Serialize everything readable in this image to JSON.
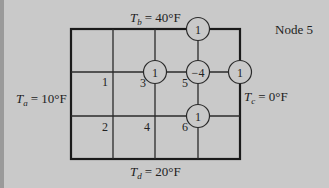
{
  "title": "Node 5",
  "boundaries": {
    "top": {
      "symbol": "T",
      "subscript": "b",
      "value": "= 40°F"
    },
    "left": {
      "symbol": "T",
      "subscript": "a",
      "value": "= 10°F"
    },
    "right": {
      "symbol": "T",
      "subscript": "c",
      "value": "= 0°F"
    },
    "bottom": {
      "symbol": "T",
      "subscript": "d",
      "value": "= 20°F"
    }
  },
  "grid": {
    "columns": 4,
    "rows": 3,
    "x_lines": [
      71,
      113,
      155,
      198,
      240
    ],
    "y_lines": [
      29,
      72,
      116,
      159
    ]
  },
  "nodes": [
    {
      "label": "1",
      "x": 113,
      "y": 72
    },
    {
      "label": "2",
      "x": 113,
      "y": 116
    },
    {
      "label": "3",
      "x": 155,
      "y": 72
    },
    {
      "label": "4",
      "x": 155,
      "y": 116
    },
    {
      "label": "5",
      "x": 198,
      "y": 72
    },
    {
      "label": "6",
      "x": 198,
      "y": 116
    }
  ],
  "stencil": [
    {
      "coef": "1",
      "x": 198,
      "y": 29
    },
    {
      "coef": "1",
      "x": 155,
      "y": 72
    },
    {
      "coef": "−4",
      "x": 198,
      "y": 72
    },
    {
      "coef": "1",
      "x": 240,
      "y": 72
    },
    {
      "coef": "1",
      "x": 198,
      "y": 116
    }
  ],
  "colors": {
    "background": "#c9c9c9",
    "line": "#1a1a1a",
    "text": "#222222"
  }
}
